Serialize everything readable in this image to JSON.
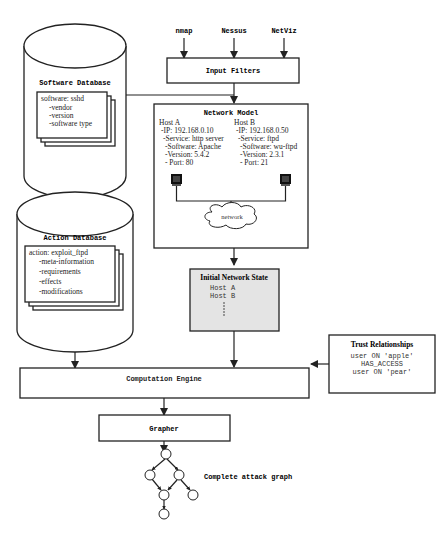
{
  "inputs": [
    "nmap",
    "Nessus",
    "NetViz"
  ],
  "input_filters": {
    "label": "Input Filters"
  },
  "software_db": {
    "title": "Software Database",
    "card": {
      "header": "software: sshd",
      "items": [
        "-vendor",
        "-version",
        "-software type"
      ]
    }
  },
  "action_db": {
    "title": "Action Database",
    "card": {
      "header": "action: exploit_ftpd",
      "items": [
        "-meta-information",
        "-requirements",
        "-effects",
        "-modifications"
      ]
    }
  },
  "network_model": {
    "title": "Network Model",
    "host_a": {
      "name": "Host A",
      "lines": [
        "-IP: 192.168.0.10",
        "-Service: http server",
        "-Software: Apache",
        "-Version: 5.4.2",
        "- Port: 80"
      ]
    },
    "host_b": {
      "name": "Host B",
      "lines": [
        "-IP: 192.168.0.50",
        "-Service: ftpd",
        "-Software: wu-ftpd",
        "-Version: 2.3.1",
        "- Port: 21"
      ]
    },
    "cloud_label": "network"
  },
  "initial_state": {
    "title": "Initial Network State",
    "hosts": [
      "Host A",
      "Host B"
    ]
  },
  "trust": {
    "title": "Trust Relationships",
    "lines": [
      "user ON 'apple'",
      "HAS_ACCESS",
      "user ON 'pear'"
    ]
  },
  "computation_engine": {
    "label": "Computation Engine"
  },
  "grapher": {
    "label": "Grapher"
  },
  "attack_graph": {
    "label": "Complete attack graph"
  },
  "colors": {
    "stroke": "#222222",
    "state_fill": "#e4e4e4",
    "background": "#ffffff"
  }
}
